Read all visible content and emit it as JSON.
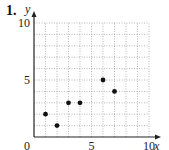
{
  "problem_number": "1.",
  "chart_data": {
    "type": "scatter",
    "title": "",
    "xlabel": "x",
    "ylabel": "y",
    "xlim": [
      0,
      10
    ],
    "ylim": [
      0,
      10
    ],
    "grid": true,
    "grid_step": 1,
    "xticks": [
      {
        "value": 0,
        "label": "0"
      },
      {
        "value": 5,
        "label": "5"
      },
      {
        "value": 10,
        "label": "10"
      }
    ],
    "yticks": [
      {
        "value": 5,
        "label": "5"
      },
      {
        "value": 10,
        "label": "10"
      }
    ],
    "series": [
      {
        "name": "points",
        "color": "#111111",
        "points": [
          {
            "x": 1,
            "y": 2
          },
          {
            "x": 2,
            "y": 1
          },
          {
            "x": 3,
            "y": 3
          },
          {
            "x": 4,
            "y": 3
          },
          {
            "x": 6,
            "y": 5
          },
          {
            "x": 7,
            "y": 4
          }
        ]
      }
    ]
  }
}
